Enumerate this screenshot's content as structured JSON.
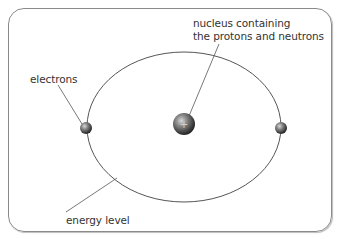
{
  "diagram": {
    "labels": {
      "nucleus_line1": "nucleus containing",
      "nucleus_line2": "the protons and neutrons",
      "electrons": "electrons",
      "energy_level": "energy level"
    },
    "nucleus_symbol": "+",
    "colors": {
      "border": "#8a8a8a",
      "orbit": "#555555",
      "leader": "#555555",
      "text": "#333333"
    }
  }
}
